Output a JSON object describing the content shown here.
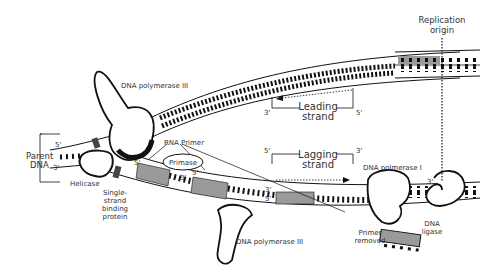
{
  "diagram": {
    "colors": {
      "outline": "#111111",
      "primer_fill": "#9a9a9a",
      "text": "#333333",
      "background": "#ffffff"
    },
    "labels": {
      "replication_origin_line1": "Replication",
      "replication_origin_line2": "origin",
      "dna_pol3_top": "DNA polymerase III",
      "dna_pol3_bottom": "DNA polymerase III",
      "dna_pol1": "DNA polmerase I",
      "rna_primer": "RNA Primer",
      "primase": "Primase",
      "parent_dna_line1": "Parent",
      "parent_dna_line2": "DNA",
      "helicase": "Helicase",
      "ssb_line1": "Single-",
      "ssb_line2": "strand",
      "ssb_line3": "binding",
      "ssb_line4": "protein",
      "leading_line1": "Leading",
      "leading_line2": "strand",
      "lagging_line1": "Lagging",
      "lagging_line2": "strand",
      "primer_removed_line1": "Primer",
      "primer_removed_line2": "removed",
      "dna_ligase_line1": "DNA",
      "dna_ligase_line2": "ligase"
    },
    "strand_ends": {
      "parent_top": "5'",
      "parent_bottom": "3'",
      "leading_left": "3'",
      "leading_right": "5'",
      "lagging_left": "5'",
      "lagging_right": "3'",
      "primer1_5": "5'",
      "primer1_3": "3'",
      "primer2_5": "5'",
      "okazaki_3": "3'",
      "okazaki_5": "5'",
      "ligase_3": "3'"
    }
  }
}
